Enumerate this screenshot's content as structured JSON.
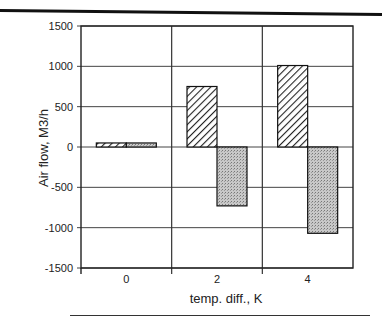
{
  "chart_data": {
    "type": "bar",
    "title": "",
    "xlabel": "temp. diff., K",
    "ylabel": "Air flow, M3/h",
    "categories": [
      "0",
      "2",
      "4"
    ],
    "series": [
      {
        "name": "hatched",
        "pattern": "diagonal-hatch",
        "values": [
          50,
          750,
          1010
        ]
      },
      {
        "name": "dotted",
        "pattern": "dotted-gray",
        "values": [
          50,
          -730,
          -1070
        ]
      }
    ],
    "ylim": [
      -1500,
      1500
    ],
    "yticks": [
      "1500",
      "1000",
      "500",
      "0",
      "-500",
      "-1000",
      "-1500"
    ],
    "grid": true,
    "legend": "none"
  }
}
